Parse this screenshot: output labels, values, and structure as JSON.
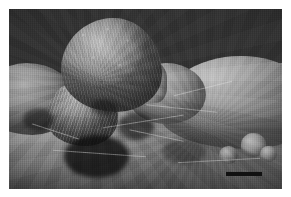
{
  "figure": {
    "kind": "scanning-electron-micrograph",
    "caption": "",
    "canvas": {
      "width": 291,
      "height": 197,
      "background_color": "#ffffff"
    },
    "plate": {
      "x": 9,
      "y": 9,
      "width": 273,
      "height": 180,
      "background_color": "#353535",
      "tissue_light_color": "#c0c0c0",
      "tissue_mid_color": "#8e8e8e",
      "shadow_color": "#141414"
    },
    "scale_bar": {
      "label": "",
      "color": "#111111",
      "x": 226,
      "y": 172,
      "width": 36,
      "height": 4
    },
    "structures": [
      {
        "name": "main-papilla",
        "label": ""
      },
      {
        "name": "second-papilla",
        "label": ""
      },
      {
        "name": "right-dome",
        "label": ""
      },
      {
        "name": "epithelial-sheet",
        "label": ""
      }
    ]
  }
}
